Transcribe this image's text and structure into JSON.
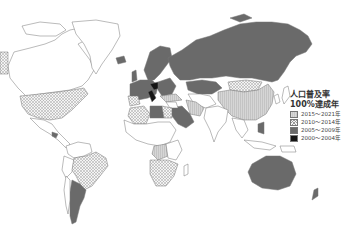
{
  "legend": {
    "title_line1": "人口普及率",
    "title_line2": "100%達成年",
    "items": [
      {
        "label": "2015〜2021年",
        "pattern": "light-gray-vertical-stripes",
        "color": "#d2d2d2"
      },
      {
        "label": "2010〜2014年",
        "pattern": "crosshatch",
        "color": "#f0f0f0"
      },
      {
        "label": "2005〜2009年",
        "pattern": "solid",
        "color": "#6a6a6a"
      },
      {
        "label": "2000〜2004年",
        "pattern": "solid",
        "color": "#151515"
      }
    ]
  },
  "map": {
    "type": "choropleth world map",
    "regions": [
      {
        "name": "North America (USA)",
        "category": "2010〜2014年"
      },
      {
        "name": "Canada",
        "category": "none"
      },
      {
        "name": "Greenland",
        "category": "none"
      },
      {
        "name": "Mexico/Central America",
        "category": "none"
      },
      {
        "name": "Brazil",
        "category": "2010〜2014年"
      },
      {
        "name": "Argentina",
        "category": "2005〜2009年"
      },
      {
        "name": "Russia",
        "category": "2005〜2009年"
      },
      {
        "name": "Europe",
        "category": "2005〜2009年"
      },
      {
        "name": "Central Europe (Czech/Italy)",
        "category": "2000〜2004年"
      },
      {
        "name": "China",
        "category": "2015〜2021年"
      },
      {
        "name": "Mongolia",
        "category": "2010〜2014年"
      },
      {
        "name": "Kazakhstan",
        "category": "2005〜2009年"
      },
      {
        "name": "Saudi Arabia",
        "category": "2005〜2009年"
      },
      {
        "name": "Libya",
        "category": "2005〜2009年"
      },
      {
        "name": "Algeria",
        "category": "2010〜2014年"
      },
      {
        "name": "Southern Africa",
        "category": "2010〜2014年"
      },
      {
        "name": "Central Africa (DRC)",
        "category": "2015〜2021年"
      },
      {
        "name": "Australia",
        "category": "2005〜2009年"
      },
      {
        "name": "India",
        "category": "none"
      },
      {
        "name": "Iran",
        "category": "2015〜2021年"
      }
    ]
  }
}
